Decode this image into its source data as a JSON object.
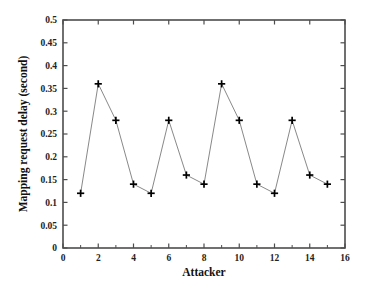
{
  "figure": {
    "background_color": "#ffffff",
    "frame_color": "#4d4d4d",
    "line_color": "#7a7a7a",
    "marker_color": "#000000",
    "marker_symbol": "plus"
  },
  "chart_data": {
    "type": "line",
    "title": "",
    "subtitle": "",
    "xlabel": "Attacker",
    "ylabel": "Mapping request delay (second)",
    "xlim": [
      0,
      16
    ],
    "ylim": [
      0,
      0.5
    ],
    "xticks": [
      0,
      2,
      4,
      6,
      8,
      10,
      12,
      14,
      16
    ],
    "xtick_labels": [
      "0",
      "2",
      "4",
      "6",
      "8",
      "10",
      "12",
      "14",
      "16"
    ],
    "x_minor_ticks": [
      1,
      3,
      5,
      7,
      9,
      11,
      13,
      15
    ],
    "yticks": [
      0,
      0.05,
      0.1,
      0.15,
      0.2,
      0.25,
      0.3,
      0.35,
      0.4,
      0.45,
      0.5
    ],
    "ytick_labels": [
      "0",
      "0.05",
      "0.1",
      "0.15",
      "0.2",
      "0.25",
      "0.3",
      "0.35",
      "0.4",
      "0.45",
      "0.5"
    ],
    "grid": false,
    "legend": null,
    "legend_position": "none",
    "marker": "+",
    "x": [
      1,
      2,
      3,
      4,
      5,
      6,
      7,
      8,
      9,
      10,
      11,
      12,
      13,
      14,
      15
    ],
    "values": [
      0.12,
      0.36,
      0.28,
      0.14,
      0.12,
      0.28,
      0.16,
      0.14,
      0.36,
      0.28,
      0.14,
      0.12,
      0.28,
      0.16,
      0.14
    ],
    "series": [
      {
        "name": "Mapping request delay",
        "x": [
          1,
          2,
          3,
          4,
          5,
          6,
          7,
          8,
          9,
          10,
          11,
          12,
          13,
          14,
          15
        ],
        "values": [
          0.12,
          0.36,
          0.28,
          0.14,
          0.12,
          0.28,
          0.16,
          0.14,
          0.36,
          0.28,
          0.14,
          0.12,
          0.28,
          0.16,
          0.14
        ]
      }
    ]
  }
}
